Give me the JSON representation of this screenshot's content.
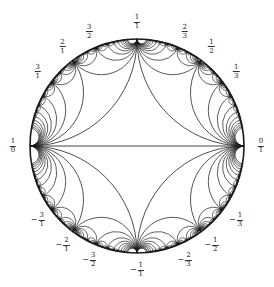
{
  "diagram": {
    "type": "farey-tessellation-poincare-disk",
    "center": [
      137,
      146
    ],
    "radius": 107,
    "label_radius": 124,
    "max_denominator_depth": 7,
    "colors": {
      "background": "#ffffff",
      "stroke": "#1a1a1a",
      "label": "#222222"
    },
    "labels": [
      {
        "name": "label-0-over-1",
        "sign": "",
        "num": "0",
        "den": "1",
        "t": 0
      },
      {
        "name": "label-1-over-3",
        "sign": "",
        "num": "1",
        "den": "3",
        "t": 0.3333
      },
      {
        "name": "label-1-over-2",
        "sign": "",
        "num": "1",
        "den": "2",
        "t": 0.5
      },
      {
        "name": "label-2-over-3",
        "sign": "",
        "num": "2",
        "den": "3",
        "t": 0.6667
      },
      {
        "name": "label-1-over-1",
        "sign": "",
        "num": "1",
        "den": "1",
        "t": 1
      },
      {
        "name": "label-3-over-2",
        "sign": "",
        "num": "3",
        "den": "2",
        "t": 1.5
      },
      {
        "name": "label-2-over-1",
        "sign": "",
        "num": "2",
        "den": "1",
        "t": 2
      },
      {
        "name": "label-3-over-1",
        "sign": "",
        "num": "3",
        "den": "1",
        "t": 3
      },
      {
        "name": "label-1-over-0",
        "sign": "",
        "num": "1",
        "den": "0",
        "t": "inf"
      },
      {
        "name": "label-neg-3-over-1",
        "sign": "−",
        "num": "3",
        "den": "1",
        "t": -3
      },
      {
        "name": "label-neg-2-over-1",
        "sign": "−",
        "num": "2",
        "den": "1",
        "t": -2
      },
      {
        "name": "label-neg-3-over-2",
        "sign": "−",
        "num": "3",
        "den": "2",
        "t": -1.5
      },
      {
        "name": "label-neg-1-over-1",
        "sign": "−",
        "num": "1",
        "den": "1",
        "t": -1
      },
      {
        "name": "label-neg-2-over-3",
        "sign": "−",
        "num": "2",
        "den": "3",
        "t": -0.6667
      },
      {
        "name": "label-neg-1-over-2",
        "sign": "−",
        "num": "1",
        "den": "2",
        "t": -0.5
      },
      {
        "name": "label-neg-1-over-3",
        "sign": "−",
        "num": "1",
        "den": "3",
        "t": -0.3333
      }
    ]
  }
}
